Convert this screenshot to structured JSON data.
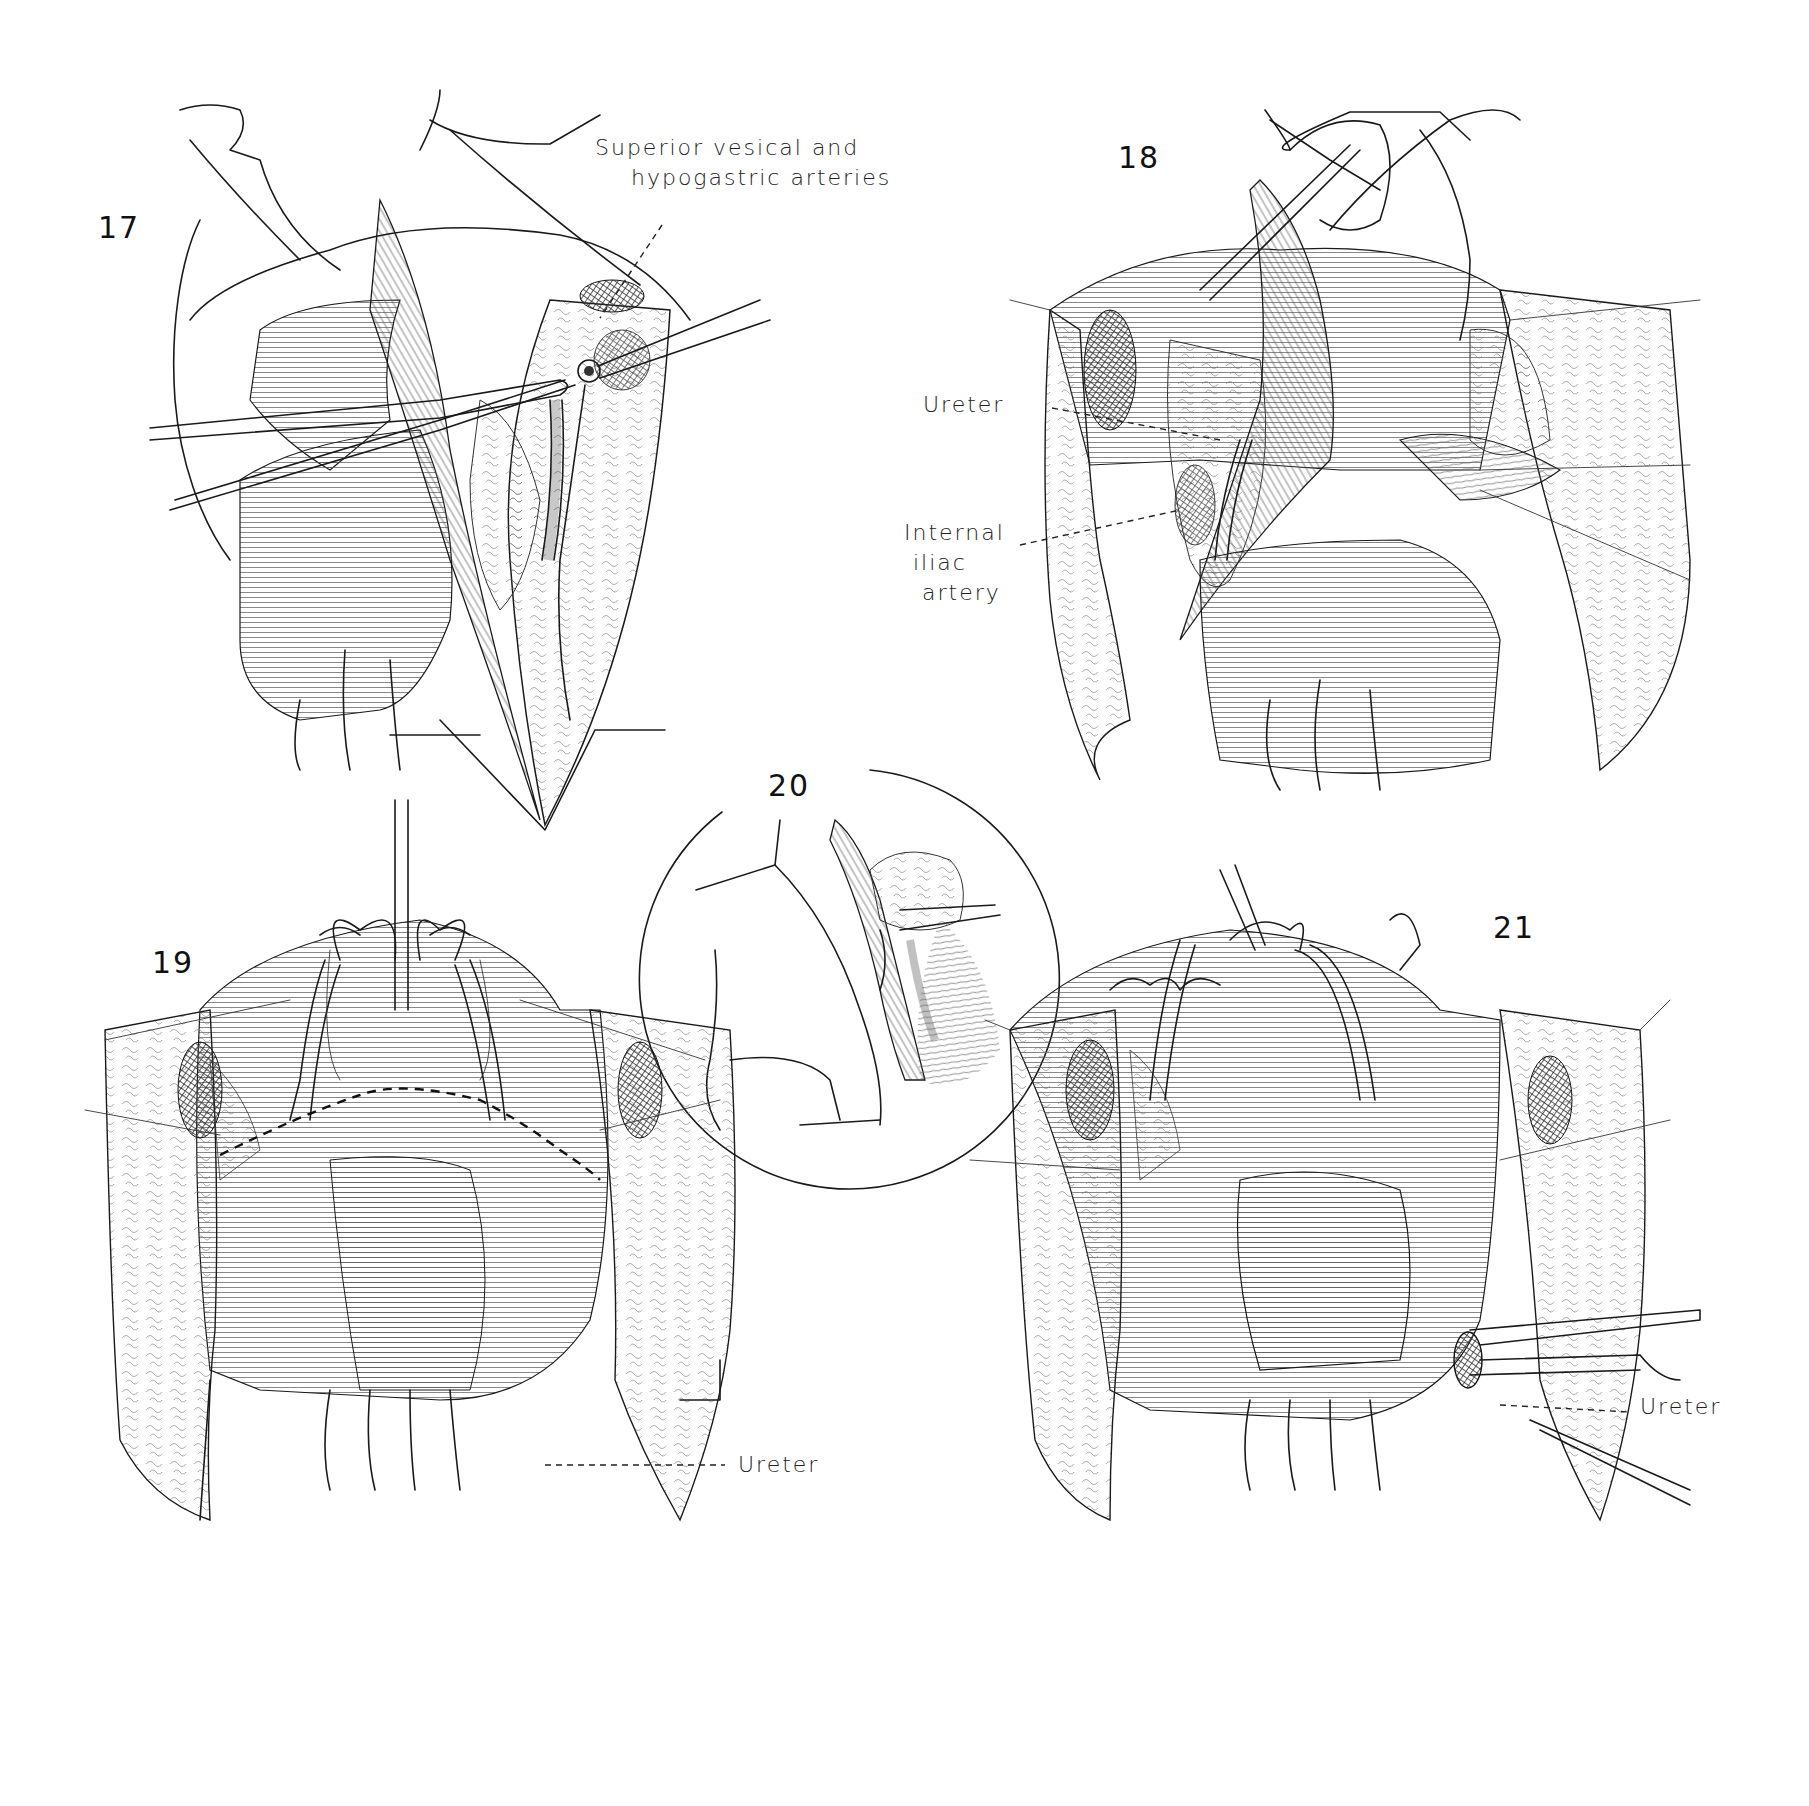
{
  "plate": {
    "figures": [
      {
        "number": "17",
        "labels": [
          {
            "text": "Superior vesical and\n    hypogastric arteries"
          }
        ]
      },
      {
        "number": "18",
        "labels": [
          {
            "text": "Ureter"
          },
          {
            "text": "Internal\n iliac\n  artery"
          }
        ]
      },
      {
        "number": "19",
        "labels": [
          {
            "text": "Ureter"
          }
        ]
      },
      {
        "number": "20",
        "labels": []
      },
      {
        "number": "21",
        "labels": [
          {
            "text": "Ureter"
          }
        ]
      }
    ]
  },
  "colors": {
    "ink": "#1a1a1a",
    "paper": "#ffffff"
  }
}
